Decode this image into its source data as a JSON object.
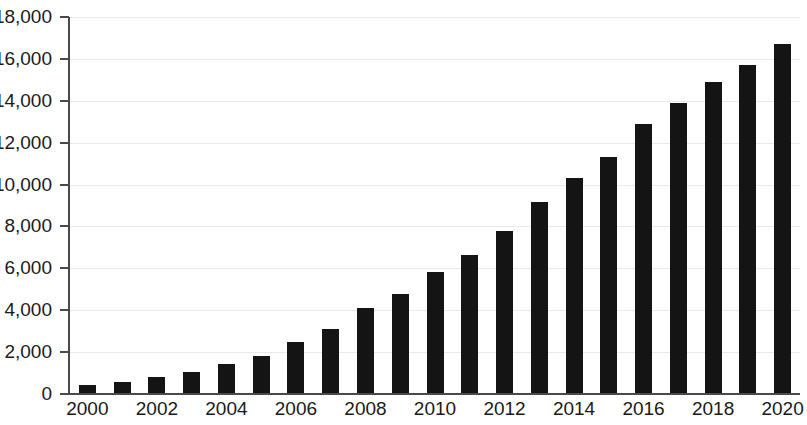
{
  "chart_data": {
    "type": "bar",
    "title": "",
    "subtitle": "",
    "xlabel": "",
    "ylabel": "",
    "categories": [
      "2000",
      "2001",
      "2002",
      "2003",
      "2004",
      "2005",
      "2006",
      "2007",
      "2008",
      "2009",
      "2010",
      "2011",
      "2012",
      "2013",
      "2014",
      "2015",
      "2016",
      "2017",
      "2018",
      "2019",
      "2020"
    ],
    "values": [
      430,
      570,
      810,
      1060,
      1450,
      1800,
      2480,
      3100,
      4130,
      4760,
      5830,
      6620,
      7800,
      9180,
      10300,
      11320,
      12900,
      13900,
      14900,
      15700,
      16700
    ],
    "series": [
      {
        "name": "",
        "values": [
          430,
          570,
          810,
          1060,
          1450,
          1800,
          2480,
          3100,
          4130,
          4760,
          5830,
          6620,
          7800,
          9180,
          10300,
          11320,
          12900,
          13900,
          14900,
          15700,
          16700
        ]
      }
    ],
    "x_tick_labels": [
      "2000",
      "2002",
      "2004",
      "2006",
      "2008",
      "2010",
      "2012",
      "2014",
      "2016",
      "2018",
      "2020"
    ],
    "y_tick_labels": [
      "0",
      "2,000",
      "4,000",
      "6,000",
      "8,000",
      "10,000",
      "12,000",
      "14,000",
      "16,000",
      "18,000"
    ],
    "y_tick_values": [
      0,
      2000,
      4000,
      6000,
      8000,
      10000,
      12000,
      14000,
      16000,
      18000
    ],
    "ylim": [
      0,
      18000
    ],
    "xlim_index": [
      0,
      20
    ],
    "grid": true,
    "grid_axis": "y",
    "legend": false,
    "legend_position": "none",
    "bar_color": "#141414",
    "gridline_color": "#e9e9e9",
    "axis_color": "#4a4a4a",
    "text_color": "#1a1a1a",
    "background_color": "#ffffff",
    "annotations": []
  }
}
